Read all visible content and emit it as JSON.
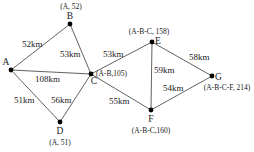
{
  "diagram": {
    "type": "weighted-graph-shortest-path",
    "nodes": [
      {
        "id": "A",
        "label": "A",
        "annotation": "",
        "x": 11,
        "y": 70
      },
      {
        "id": "B",
        "label": "B",
        "annotation": "(A, 52)",
        "x": 70,
        "y": 24
      },
      {
        "id": "C",
        "label": "C",
        "annotation": "(A-B,105)",
        "x": 91,
        "y": 74
      },
      {
        "id": "D",
        "label": "D",
        "annotation": "(A, 51)",
        "x": 60,
        "y": 122
      },
      {
        "id": "E",
        "label": "E",
        "annotation": "(A-B-C, 158)",
        "x": 152,
        "y": 42
      },
      {
        "id": "F",
        "label": "F",
        "annotation": "(A-B-C,160)",
        "x": 151,
        "y": 110
      },
      {
        "id": "G",
        "label": "G",
        "annotation": "(A-B-C-F, 214)",
        "x": 212,
        "y": 76
      }
    ],
    "edges": [
      {
        "from": "A",
        "to": "B",
        "label": "52km"
      },
      {
        "from": "B",
        "to": "C",
        "label": "53km"
      },
      {
        "from": "A",
        "to": "C",
        "label": "108km"
      },
      {
        "from": "A",
        "to": "D",
        "label": "51km"
      },
      {
        "from": "D",
        "to": "C",
        "label": "56km"
      },
      {
        "from": "C",
        "to": "E",
        "label": "53km"
      },
      {
        "from": "C",
        "to": "F",
        "label": "55km"
      },
      {
        "from": "E",
        "to": "F",
        "label": "59km"
      },
      {
        "from": "E",
        "to": "G",
        "label": "58km"
      },
      {
        "from": "F",
        "to": "G",
        "label": "54km"
      }
    ]
  }
}
